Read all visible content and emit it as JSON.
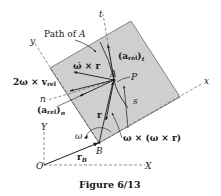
{
  "figure": {
    "caption": "Figure 6/13",
    "colors": {
      "plate_fill": "#cfcfcf",
      "plate_edge": "#6a6a6a",
      "ink": "#1a1a1a",
      "background": "#ffffff"
    },
    "labels": {
      "path_of_A": "Path of A",
      "path_of_A_prefix": "Path of ",
      "path_of_A_point": "A",
      "a_rel_t": "(a",
      "a_rel_t_sub": "rel",
      "a_rel_t_close": ")",
      "a_rel_t_index": "t",
      "omega_dot_x_r": "ω̇ × r",
      "point_A": "A",
      "point_P": "P",
      "two_omega_x_vrel": "2ω × v",
      "two_omega_x_vrel_sub": "rel",
      "n_axis": "n",
      "a_rel_n": "(a",
      "a_rel_n_sub": "rel",
      "a_rel_n_close": ")",
      "a_rel_n_index": "n",
      "s_coord": "s",
      "r_vector": "r",
      "omega": "ω",
      "centripetal": "ω × (ω × r)",
      "point_B": "B",
      "r_B": "r",
      "r_B_sub": "B",
      "origin_O": "O",
      "axis_X": "X",
      "axis_Y": "Y",
      "axis_x": "x",
      "axis_y": "y",
      "axis_t": "t"
    }
  }
}
